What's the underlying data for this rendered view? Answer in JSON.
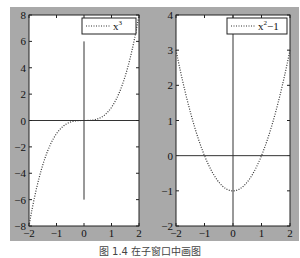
{
  "caption": "图 1.4 在子窗口中画图",
  "chart_data": [
    {
      "type": "line",
      "title": "",
      "xlabel": "",
      "ylabel": "",
      "xlim": [
        -2,
        2
      ],
      "ylim": [
        -8,
        8
      ],
      "xticks": [
        -2,
        -1,
        0,
        1,
        2
      ],
      "yticks": [
        -8,
        -6,
        -4,
        -2,
        0,
        2,
        4,
        6,
        8
      ],
      "xtick_labels": [
        "-2",
        "-1",
        "0",
        "1",
        "2"
      ],
      "ytick_labels": [
        "-8",
        "-6",
        "-4",
        "-2",
        "0",
        "2",
        "4",
        "6",
        "8"
      ],
      "grid": false,
      "legend": {
        "position": "top-right",
        "entries": [
          {
            "base": "x",
            "sup": "3"
          }
        ]
      },
      "series": [
        {
          "name": "x^3",
          "function": "x^3",
          "style": "dotted",
          "x": [
            -2,
            -1.5,
            -1,
            -0.5,
            0,
            0.5,
            1,
            1.5,
            2
          ],
          "y": [
            -8,
            -3.375,
            -1,
            -0.125,
            0,
            0.125,
            1,
            3.375,
            8
          ]
        }
      ],
      "axes_lines": {
        "horizontal": {
          "y": 0,
          "x_from": -2,
          "x_to": 2
        },
        "vertical": {
          "x": 0,
          "y_from": -6,
          "y_to": 6
        }
      }
    },
    {
      "type": "line",
      "title": "",
      "xlabel": "",
      "ylabel": "",
      "xlim": [
        -2,
        2
      ],
      "ylim": [
        -2,
        4
      ],
      "xticks": [
        -2,
        -1,
        0,
        1,
        2
      ],
      "yticks": [
        -2,
        -1,
        0,
        1,
        2,
        3,
        4
      ],
      "xtick_labels": [
        "-2",
        "-1",
        "0",
        "1",
        "2"
      ],
      "ytick_labels": [
        "-2",
        "-1",
        "0",
        "1",
        "2",
        "3",
        "4"
      ],
      "grid": false,
      "legend": {
        "position": "top-right",
        "entries": [
          {
            "base": "x",
            "sup": "2",
            "suffix": "−1"
          }
        ]
      },
      "series": [
        {
          "name": "x^2-1",
          "function": "x^2-1",
          "style": "dotted",
          "x": [
            -2,
            -1.5,
            -1,
            -0.5,
            0,
            0.5,
            1,
            1.5,
            2
          ],
          "y": [
            3,
            1.25,
            0,
            -0.75,
            -1,
            -0.75,
            0,
            1.25,
            3
          ]
        }
      ],
      "axes_lines": {
        "horizontal": {
          "y": 0,
          "x_from": -2,
          "x_to": 2
        },
        "vertical": {
          "x": 0,
          "y_from": -2,
          "y_to": 4
        }
      }
    }
  ]
}
